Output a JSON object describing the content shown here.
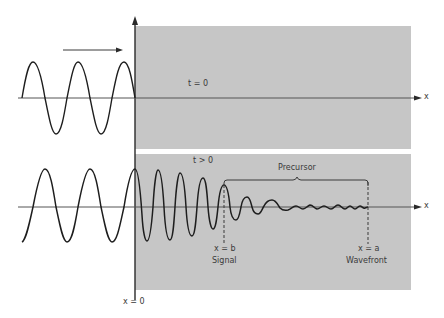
{
  "figure": {
    "top_panel": {
      "time_label": "t = 0",
      "axis_label": "x"
    },
    "bottom_panel": {
      "time_label": "t > 0",
      "axis_label": "x",
      "brace_label": "Precursor",
      "signal_position": "x = b",
      "signal_label": "Signal",
      "wavefront_position": "x = a",
      "wavefront_label": "Wavefront"
    },
    "boundary_label": "x = 0"
  },
  "colors": {
    "medium_fill": "#c4c4c4",
    "line": "#2a2a2a",
    "background": "#ffffff"
  }
}
